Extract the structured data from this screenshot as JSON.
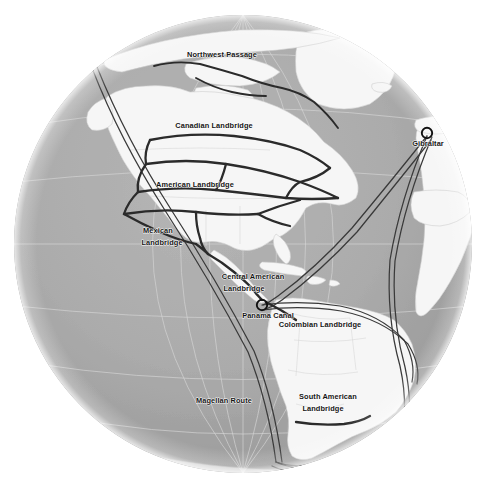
{
  "map": {
    "projection": "orthographic-globe",
    "center_focus": "Americas",
    "colors": {
      "background": "#ffffff",
      "ocean": "#ababab",
      "ocean_shadow": "#8f8f8f",
      "land": "#f6f6f6",
      "land_outline": "#c9c9c9",
      "graticule": "#d2d2d2",
      "landbridge_route": "#2b2b2b",
      "shipping_route": "#3a3a3a",
      "label_text": "#151515",
      "marker_stroke": "#111111"
    },
    "globe": {
      "cx": 243,
      "cy": 244,
      "r": 229
    },
    "labels": [
      {
        "id": "northwest-passage",
        "text": "Northwest Passage",
        "x": 222,
        "y": 57,
        "anchor": "middle"
      },
      {
        "id": "canadian-landbridge",
        "text": "Canadian Landbridge",
        "x": 214,
        "y": 128,
        "anchor": "middle"
      },
      {
        "id": "american-landbridge",
        "text": "American Landbridge",
        "x": 195,
        "y": 187,
        "anchor": "middle"
      },
      {
        "id": "mexican-landbridge-l1",
        "text": "Mexican",
        "x": 158,
        "y": 233,
        "anchor": "middle"
      },
      {
        "id": "mexican-landbridge-l2",
        "text": "Landbridge",
        "x": 162,
        "y": 245,
        "anchor": "middle"
      },
      {
        "id": "central-american-l1",
        "text": "Central American",
        "x": 253,
        "y": 279,
        "anchor": "middle"
      },
      {
        "id": "central-american-l2",
        "text": "Landbridge",
        "x": 244,
        "y": 291,
        "anchor": "middle"
      },
      {
        "id": "panama-canal",
        "text": "Panama Canal",
        "x": 268,
        "y": 318,
        "anchor": "middle"
      },
      {
        "id": "colombian-landbridge",
        "text": "Colombian Landbridge",
        "x": 320,
        "y": 327,
        "anchor": "middle"
      },
      {
        "id": "south-american-l1",
        "text": "South American",
        "x": 328,
        "y": 399,
        "anchor": "middle"
      },
      {
        "id": "south-american-l2",
        "text": "Landbridge",
        "x": 323,
        "y": 411,
        "anchor": "middle"
      },
      {
        "id": "magellan-route",
        "text": "Magellan Route",
        "x": 224,
        "y": 403,
        "anchor": "middle"
      },
      {
        "id": "gibraltar",
        "text": "Gibraltar",
        "x": 428,
        "y": 146,
        "anchor": "middle"
      }
    ],
    "markers": [
      {
        "id": "panama-canal-marker",
        "label": "Panama Canal",
        "x": 262,
        "y": 305,
        "r": 5.2
      },
      {
        "id": "gibraltar-marker",
        "label": "Gibraltar",
        "x": 427,
        "y": 133,
        "r": 5.2
      }
    ],
    "routes": [
      {
        "id": "northwest-passage-route",
        "name": "Northwest Passage"
      },
      {
        "id": "canadian-landbridge-route",
        "name": "Canadian Landbridge"
      },
      {
        "id": "american-landbridge-route",
        "name": "American Landbridge"
      },
      {
        "id": "mexican-landbridge-route",
        "name": "Mexican Landbridge"
      },
      {
        "id": "central-american-route",
        "name": "Central American Landbridge"
      },
      {
        "id": "colombian-route",
        "name": "Colombian Landbridge"
      },
      {
        "id": "south-american-route",
        "name": "South American Landbridge"
      },
      {
        "id": "pacific-shipping-lane",
        "name": "Pacific Shipping Lane"
      },
      {
        "id": "atlantic-shipping-lane",
        "name": "Atlantic Shipping Lane"
      },
      {
        "id": "magellan-route-line",
        "name": "Magellan Route"
      }
    ]
  }
}
